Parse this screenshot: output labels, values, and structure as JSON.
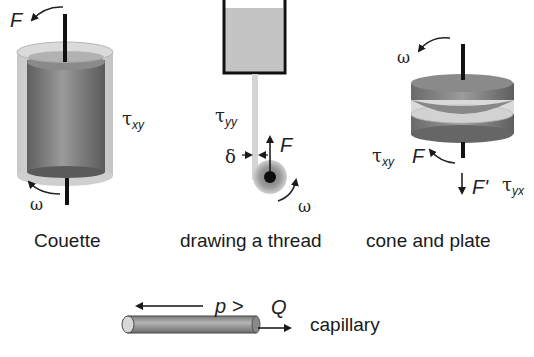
{
  "diagram": {
    "panels": [
      {
        "id": "couette",
        "caption": "Couette",
        "labels": {
          "force": "F",
          "stress": "τ",
          "stress_sub": "xy",
          "angular": "ω"
        }
      },
      {
        "id": "drawing-thread",
        "caption": "drawing a thread",
        "labels": {
          "stress": "τ",
          "stress_sub": "yy",
          "force": "F",
          "thickness": "δ",
          "angular": "ω"
        }
      },
      {
        "id": "cone-plate",
        "caption": "cone and plate",
        "labels": {
          "angular": "ω",
          "stress1": "τ",
          "stress1_sub": "xy",
          "force": "F",
          "normal_force": "F'",
          "stress2": "τ",
          "stress2_sub": "yx"
        }
      },
      {
        "id": "capillary",
        "caption": "capillary",
        "labels": {
          "pressure": "p >",
          "flow": "Q"
        }
      }
    ],
    "colors": {
      "cylinder_dark": "#6e6e6e",
      "cylinder_light": "#d8d8d8",
      "liquid": "#bdbdbd",
      "stroke": "#1a1a1a"
    }
  }
}
